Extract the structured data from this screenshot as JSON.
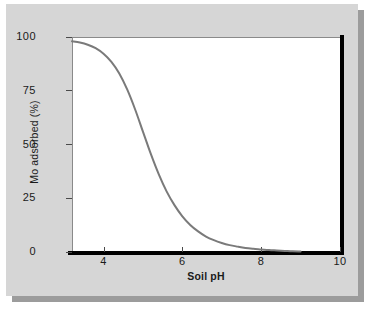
{
  "figure": {
    "background_color": "#d6d6d6",
    "plot_background_color": "#ffffff",
    "shadow_color": "#9c9c9c",
    "axis_color": "#000000",
    "curve_color": "#7a7a7a"
  },
  "chart_data": {
    "type": "line",
    "title": "",
    "subtitle": "",
    "xlabel": "Soil pH",
    "ylabel": "Mo adsorbed (%)",
    "xlim": [
      3.2,
      10
    ],
    "ylim": [
      0,
      100
    ],
    "grid": false,
    "legend": null,
    "x_ticks": [
      4,
      6,
      8,
      10
    ],
    "x_tick_labels": [
      "4",
      "6",
      "8",
      "10"
    ],
    "y_ticks": [
      0,
      25,
      50,
      75,
      100
    ],
    "y_tick_labels": [
      "0",
      "25",
      "50",
      "75",
      "100"
    ],
    "series": [
      {
        "name": "Mo adsorbed",
        "color": "#7a7a7a",
        "line_width": 2,
        "x": [
          3.2,
          3.4,
          3.6,
          3.8,
          4.0,
          4.2,
          4.4,
          4.6,
          4.8,
          5.0,
          5.2,
          5.4,
          5.6,
          5.8,
          6.0,
          6.2,
          6.4,
          6.6,
          6.8,
          7.0,
          7.2,
          7.4,
          7.6,
          7.8,
          8.0,
          8.2,
          8.4,
          8.6,
          8.8,
          9.0
        ],
        "y": [
          98.0,
          97.4,
          96.4,
          94.8,
          92.2,
          88.4,
          83.0,
          75.6,
          66.4,
          56.0,
          45.6,
          36.2,
          28.2,
          21.8,
          16.6,
          12.6,
          9.6,
          7.2,
          5.5,
          4.2,
          3.2,
          2.5,
          1.9,
          1.5,
          1.2,
          0.9,
          0.7,
          0.5,
          0.3,
          0.2
        ]
      }
    ],
    "annotations": []
  }
}
